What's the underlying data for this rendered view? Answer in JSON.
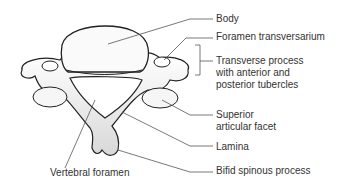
{
  "labels": {
    "body": "Body",
    "foramen_transversarium": "Foramen transversarium",
    "transverse_process_1": "Transverse process",
    "transverse_process_2": "with anterior and",
    "transverse_process_3": "posterior tubercles",
    "superior_facet_1": "Superior",
    "superior_facet_2": "articular facet",
    "lamina": "Lamina",
    "bifid_spinous_process": "Bifid spinous process",
    "vertebral_foramen": "Vertebral foramen"
  },
  "colors": {
    "bone_fill": "#f2f2f2",
    "bone_stroke": "#222222",
    "leader": "#555555",
    "text": "#333333"
  }
}
